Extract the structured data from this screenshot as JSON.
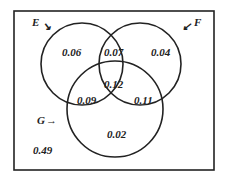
{
  "diagram": {
    "type": "venn-3",
    "sets": [
      {
        "name": "E",
        "arrow": "↘"
      },
      {
        "name": "F",
        "arrow": "↙"
      },
      {
        "name": "G",
        "arrow": "→"
      }
    ],
    "regions": {
      "E_only": "0.06",
      "E_and_F_only": "0.07",
      "F_only": "0.04",
      "E_F_G": "0.12",
      "E_and_G_only": "0.09",
      "F_and_G_only": "0.11",
      "G_only": "0.02",
      "outside": "0.49"
    }
  }
}
